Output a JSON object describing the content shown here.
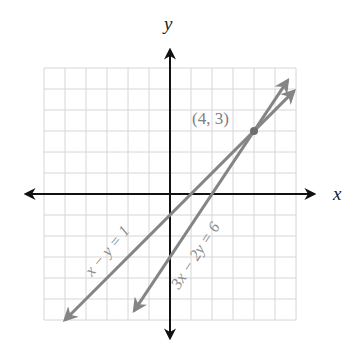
{
  "chart_data": {
    "type": "line",
    "title": "",
    "xlabel": "x",
    "ylabel": "y",
    "xlim": [
      -6,
      6
    ],
    "ylim": [
      -6,
      6
    ],
    "grid": true,
    "grid_step": 1,
    "series": [
      {
        "name": "x − y = 1",
        "equation": "x - y = 1",
        "slope": 1,
        "intercept": -1,
        "x": [
          -5,
          5.9
        ],
        "y": [
          -6,
          4.9
        ],
        "arrows": "both"
      },
      {
        "name": "3x − 2y = 6",
        "equation": "3x - 2y = 6",
        "slope": 1.5,
        "intercept": -3,
        "x": [
          -1.7,
          5.6
        ],
        "y": [
          -5.55,
          5.4
        ],
        "arrows": "both"
      }
    ],
    "annotations": [
      {
        "text": "(4, 3)",
        "x": 4,
        "y": 3,
        "type": "intersection-point"
      }
    ]
  },
  "labels": {
    "x_axis": "x",
    "y_axis": "y",
    "point": "(4, 3)",
    "line1": "x − y = 1",
    "line2": "3x − 2y = 6"
  },
  "colors": {
    "axis": "#111111",
    "grid": "#d6d6d6",
    "line": "#858585",
    "point": "#6e6e6e",
    "label": "#808080",
    "axis_label": "#222222"
  }
}
